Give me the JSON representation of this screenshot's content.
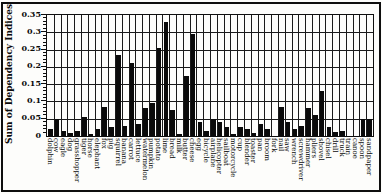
{
  "figure": {
    "background": "#fdfdfb",
    "border_color": "#0e0e0e"
  },
  "chart_data": {
    "type": "bar",
    "title": "",
    "xlabel": "",
    "ylabel": "Sum of Dependency Indices",
    "ylim": [
      0,
      0.35
    ],
    "ytick_step": 0.05,
    "ytick_minor_step": 0.01,
    "yticks": [
      "0",
      "0.05",
      "0.1",
      "0.15",
      "0.2",
      "0.25",
      "0.3",
      "0.35"
    ],
    "grid": "both",
    "legend": "none",
    "bar_color": "#0a0a0a",
    "categories": [
      "dolphin",
      "cow",
      "eagle",
      "dog",
      "grasshopper",
      "tiger",
      "horse",
      "elephant",
      "fox",
      "pig",
      "squirrel",
      "banana",
      "carrot",
      "lettuce",
      "watermelon",
      "pumpkin",
      "potato",
      "lime",
      "bread",
      "milk",
      "butter",
      "cheese",
      "egg",
      "bicycle",
      "airplane",
      "helicopter",
      "sailboat",
      "motorcycle",
      "cup",
      "blender",
      "toaster",
      "pan",
      "broom",
      "fork",
      "nail",
      "saw",
      "wrench",
      "screwdriver",
      "hammer",
      "pliers",
      "shovel",
      "chisel",
      "drill",
      "truck",
      "train",
      "canoe",
      "spoon",
      "sandpaper"
    ],
    "values": [
      0.02,
      0.05,
      0.015,
      0.01,
      0.015,
      0.055,
      0.005,
      0.02,
      0.085,
      0.025,
      0.235,
      0.03,
      0.21,
      0.035,
      0.08,
      0.095,
      0.255,
      0.33,
      0.075,
      0.005,
      0.175,
      0.295,
      0.04,
      0.015,
      0.05,
      0.04,
      0.025,
      0.005,
      0.025,
      0.02,
      0.01,
      0.035,
      0.02,
      0,
      0.085,
      0.04,
      0.02,
      0.03,
      0.08,
      0.06,
      0.13,
      0.025,
      0.012,
      0.015,
      0,
      0,
      0.05,
      0.05
    ]
  }
}
